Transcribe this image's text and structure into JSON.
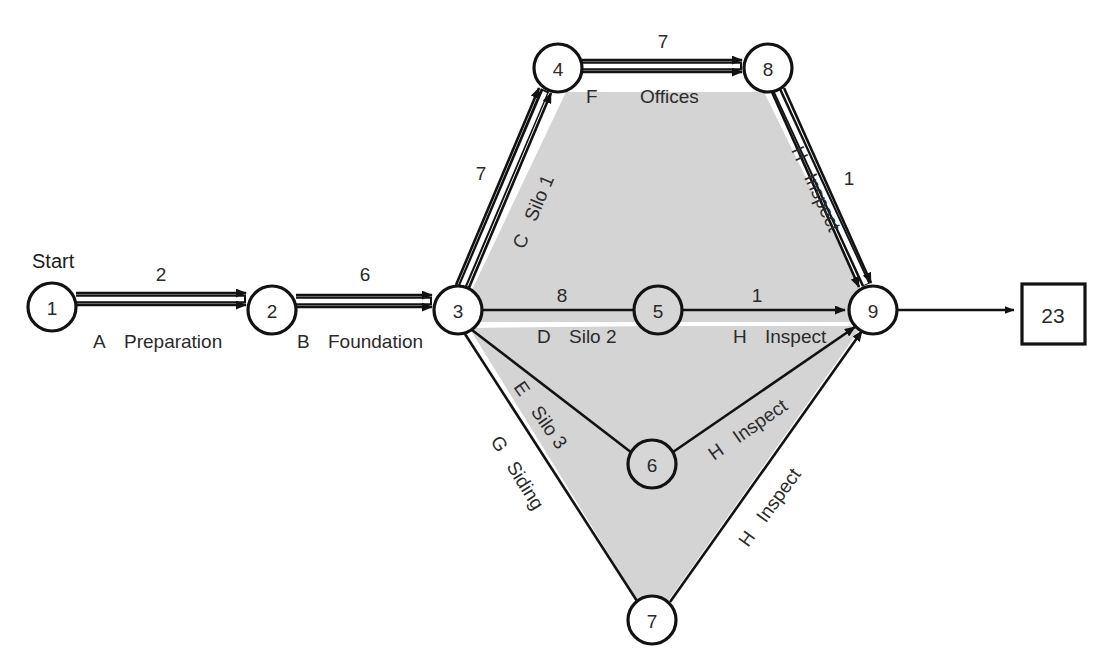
{
  "diagram": {
    "type": "project-network-pert",
    "start_label": "Start",
    "end_value": "23",
    "canvas": {
      "width": 1103,
      "height": 669
    },
    "nodes": [
      {
        "id": "1",
        "label": "1",
        "x": 52,
        "y": 307,
        "r": 24,
        "shaded": false
      },
      {
        "id": "2",
        "label": "2",
        "x": 272,
        "y": 310,
        "r": 24,
        "shaded": false
      },
      {
        "id": "3",
        "label": "3",
        "x": 458,
        "y": 310,
        "r": 24,
        "shaded": false
      },
      {
        "id": "4",
        "label": "4",
        "x": 558,
        "y": 68,
        "r": 24,
        "shaded": false
      },
      {
        "id": "5",
        "label": "5",
        "x": 658,
        "y": 310,
        "r": 24,
        "shaded": true
      },
      {
        "id": "6",
        "label": "6",
        "x": 652,
        "y": 464,
        "r": 24,
        "shaded": true
      },
      {
        "id": "7",
        "label": "7",
        "x": 652,
        "y": 620,
        "r": 24,
        "shaded": false
      },
      {
        "id": "8",
        "label": "8",
        "x": 768,
        "y": 68,
        "r": 24,
        "shaded": false
      },
      {
        "id": "9",
        "label": "9",
        "x": 873,
        "y": 310,
        "r": 24,
        "shaded": false
      }
    ],
    "edges": [
      {
        "id": "A",
        "from": "1",
        "to": "2",
        "code": "A",
        "name": "Preparation",
        "duration": "2",
        "critical": true
      },
      {
        "id": "B",
        "from": "2",
        "to": "3",
        "code": "B",
        "name": "Foundation",
        "duration": "6",
        "critical": true
      },
      {
        "id": "C",
        "from": "3",
        "to": "4",
        "code": "C",
        "name": "Silo 1",
        "duration": "7",
        "critical": true
      },
      {
        "id": "F",
        "from": "4",
        "to": "8",
        "code": "F",
        "name": "Offices",
        "duration": "7",
        "critical": true
      },
      {
        "id": "H8",
        "from": "8",
        "to": "9",
        "code": "H",
        "name": "Inspect",
        "duration": "1",
        "critical": true
      },
      {
        "id": "D",
        "from": "3",
        "to": "5",
        "code": "D",
        "name": "Silo 2",
        "duration": "8",
        "critical": false
      },
      {
        "id": "H5",
        "from": "5",
        "to": "9",
        "code": "H",
        "name": "Inspect",
        "duration": "1",
        "critical": false
      },
      {
        "id": "E",
        "from": "3",
        "to": "6",
        "code": "E",
        "name": "Silo 3",
        "duration": "",
        "critical": false
      },
      {
        "id": "H6",
        "from": "6",
        "to": "9",
        "code": "H",
        "name": "Inspect",
        "duration": "",
        "critical": false
      },
      {
        "id": "G",
        "from": "3",
        "to": "7",
        "code": "G",
        "name": "Siding",
        "duration": "",
        "critical": false
      },
      {
        "id": "H7",
        "from": "7",
        "to": "9",
        "code": "H",
        "name": "Inspect",
        "duration": "",
        "critical": false
      },
      {
        "id": "END",
        "from": "9",
        "to": "end-box",
        "code": "",
        "name": "",
        "duration": "",
        "critical": false
      }
    ],
    "labels": {
      "dur_A": "2",
      "dur_B": "6",
      "dur_C": "7",
      "dur_F": "7",
      "dur_D": "8",
      "dur_H5": "1",
      "dur_H8": "1",
      "code_A": "A",
      "name_A": "Preparation",
      "code_B": "B",
      "name_B": "Foundation",
      "code_C": "C",
      "name_C": "Silo 1",
      "code_F": "F",
      "name_F": "Offices",
      "code_D": "D",
      "name_D": "Silo 2",
      "code_E": "E",
      "name_E": "Silo 3",
      "code_G": "G",
      "name_G": "Siding",
      "code_H5": "H",
      "name_H5": "Inspect",
      "code_H6": "H",
      "name_H6": "Inspect",
      "code_H7": "H",
      "name_H7": "Inspect",
      "code_H8": "H",
      "name_H8": "Inspect"
    },
    "colors": {
      "line": "#121212",
      "region": "#d4d4d4",
      "node_fill": "#ffffff",
      "text": "#2a2a2a",
      "background": "#ffffff"
    }
  }
}
